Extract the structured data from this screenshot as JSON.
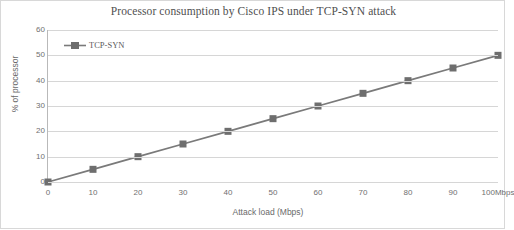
{
  "chart_data": {
    "type": "line",
    "title": "Processor consumption by Cisco IPS under TCP-SYN attack",
    "xlabel": "Attack load (Mbps)",
    "ylabel": "% of processor",
    "x": [
      0,
      10,
      20,
      30,
      40,
      50,
      60,
      70,
      80,
      90,
      100
    ],
    "xtick_labels": [
      "0",
      "10",
      "20",
      "30",
      "40",
      "50",
      "60",
      "70",
      "80",
      "90",
      "100Mbps"
    ],
    "ytick_labels": [
      "0",
      "10",
      "20",
      "30",
      "40",
      "50",
      "60"
    ],
    "yticks": [
      0,
      10,
      20,
      30,
      40,
      50,
      60
    ],
    "ylim": [
      0,
      60
    ],
    "xlim": [
      0,
      100
    ],
    "grid": "horizontal",
    "legend_position": "top-left-inside",
    "series": [
      {
        "name": "TCP-SYN",
        "color": "#7a7a7a",
        "marker": "square",
        "values": [
          0,
          5,
          10,
          15,
          20,
          25,
          30,
          35,
          40,
          45,
          50
        ]
      }
    ]
  },
  "legend": {
    "label": "TCP-SYN"
  }
}
